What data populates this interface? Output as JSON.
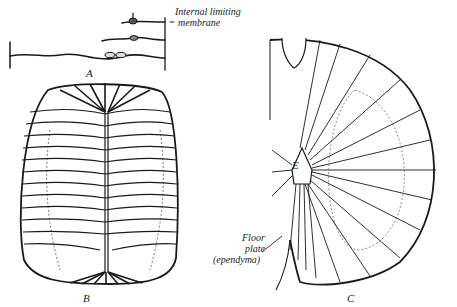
{
  "figure": {
    "panels": [
      {
        "id": "A",
        "label": "A",
        "description": "Sparse spongioblast-like cells stretched between limiting membranes"
      },
      {
        "id": "B",
        "label": "B",
        "description": "Transverse section of neural tube with radial ependymal/glial fibers and central canal"
      },
      {
        "id": "C",
        "label": "C",
        "description": "Half of spinal cord cross section with radiating glial fibers from ependyma"
      }
    ],
    "annotations": {
      "internal_limiting_line1": "Internal limiting",
      "internal_limiting_line2": "membrane",
      "ependyma_marker": "E",
      "floor_plate_line1": "Floor",
      "floor_plate_line2": "plate",
      "floor_plate_line3": "(ependyma)"
    },
    "colors": {
      "ink": "#1a1a1a",
      "paper": "#ffffff"
    }
  }
}
